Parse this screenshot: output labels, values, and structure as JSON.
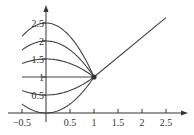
{
  "chart_data": {
    "type": "line",
    "title": "",
    "xlabel": "",
    "ylabel": "",
    "xlim": [
      -0.5,
      2.6
    ],
    "ylim": [
      0,
      2.75
    ],
    "grid": false,
    "legend": null,
    "x_ticks": [
      -0.5,
      0.5,
      1,
      1.5,
      2,
      2.5
    ],
    "x_tick_labels": [
      "−0.5",
      "0.5",
      "1",
      "1.5",
      "2",
      "2.5"
    ],
    "y_ticks": [
      0.5,
      1,
      1.5,
      2,
      2.5
    ],
    "y_tick_labels": [
      "0.5",
      "1",
      "1.5",
      "2",
      "2.5"
    ],
    "annotations": [
      {
        "type": "point",
        "x": 1,
        "y": 1,
        "label": "common intersection point"
      }
    ],
    "series": [
      {
        "name": "parabola c=2.5",
        "formula": "y = 2.5 - 1.5x^2",
        "domain": [
          -0.5,
          1
        ],
        "x": [
          -0.5,
          0,
          0.5,
          1
        ],
        "values": [
          2.125,
          2.5,
          2.125,
          1
        ]
      },
      {
        "name": "parabola c=2",
        "formula": "y = 2 - x^2",
        "domain": [
          -0.5,
          1
        ],
        "x": [
          -0.5,
          0,
          0.5,
          1
        ],
        "values": [
          1.75,
          2,
          1.75,
          1
        ]
      },
      {
        "name": "parabola c=1.5",
        "formula": "y = 1.5 - 0.5x^2",
        "domain": [
          -0.5,
          1
        ],
        "x": [
          -0.5,
          0,
          0.5,
          1
        ],
        "values": [
          1.375,
          1.5,
          1.375,
          1
        ]
      },
      {
        "name": "line c=1",
        "formula": "y = 1",
        "domain": [
          -0.5,
          1
        ],
        "x": [
          -0.5,
          0,
          0.5,
          1
        ],
        "values": [
          1,
          1,
          1,
          1
        ]
      },
      {
        "name": "parabola c=0.5",
        "formula": "y = 0.5 + 0.5x^2",
        "domain": [
          -0.5,
          1
        ],
        "x": [
          -0.5,
          0,
          0.5,
          1
        ],
        "values": [
          0.625,
          0.5,
          0.625,
          1
        ]
      },
      {
        "name": "parabola c=0",
        "formula": "y = x^2",
        "domain": [
          -0.5,
          1
        ],
        "x": [
          -0.5,
          0,
          0.5,
          1
        ],
        "values": [
          0.25,
          0,
          0.25,
          1
        ]
      },
      {
        "name": "ray",
        "formula": "y = 1 + 1.1(x - 1)",
        "domain": [
          1,
          2.5
        ],
        "x": [
          1,
          2.5
        ],
        "values": [
          1,
          2.65
        ]
      }
    ]
  },
  "style": {
    "curve_color": "#444444",
    "axis_color": "#333333",
    "point_color": "#333333"
  }
}
